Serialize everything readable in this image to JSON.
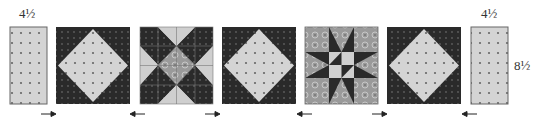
{
  "diagram": {
    "type": "quilt-row-assembly",
    "labels": {
      "left_width": "4½",
      "right_width": "4½",
      "right_height": "8½"
    },
    "colors": {
      "light_fabric": "#d4d4d4",
      "dark_fabric": "#2a2a2a",
      "print_fabric": "#9a9a9a",
      "border": "#555555",
      "dot": "#555555",
      "arrow": "#222222"
    },
    "pieces": [
      {
        "name": "left-rectangle",
        "kind": "rectangle",
        "press": null
      },
      {
        "name": "block-1",
        "kind": "square-in-a-square",
        "press": "right"
      },
      {
        "name": "block-2",
        "kind": "star-variation",
        "press": "left"
      },
      {
        "name": "block-3",
        "kind": "square-in-a-square",
        "press": "right"
      },
      {
        "name": "block-4",
        "kind": "ohio-star",
        "press": "left"
      },
      {
        "name": "block-5",
        "kind": "square-in-a-square",
        "press": "right"
      },
      {
        "name": "right-rectangle",
        "kind": "rectangle",
        "press": "left"
      }
    ],
    "arrows": [
      "right",
      "left",
      "right",
      "left",
      "right",
      "left"
    ]
  }
}
